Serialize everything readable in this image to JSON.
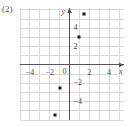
{
  "figure": {
    "item_label": "(2)",
    "background_color": "#ffffff",
    "grid_color": "#d9d9d9",
    "axis_color": "#555555",
    "point_color": "#1a1a1a",
    "label_color": "#4a4a4a"
  },
  "chart_data": {
    "type": "scatter",
    "title": "",
    "subtitle": "",
    "xlabel": "x",
    "ylabel": "y",
    "xlim": [
      -5,
      5.5
    ],
    "ylim": [
      -6,
      6.2
    ],
    "grid": true,
    "legend": false,
    "legend_position": "none",
    "xticks": [
      -4,
      -2,
      0,
      2,
      4
    ],
    "xtick_labels": [
      "−4",
      "−2",
      "0",
      "2",
      "4"
    ],
    "yticks": [
      -4,
      -2,
      2,
      4
    ],
    "ytick_labels": [
      "−4",
      "−2",
      "2",
      "4"
    ],
    "origin_label": "0",
    "x_axis_arrow": true,
    "y_axis_arrow": true,
    "points": [
      {
        "x": 1.5,
        "y": 5.5
      },
      {
        "x": 1.0,
        "y": 3.0
      },
      {
        "x": -1.0,
        "y": -2.5
      },
      {
        "x": -1.5,
        "y": -5.5
      }
    ],
    "series": [
      {
        "name": "points",
        "x": [
          1.5,
          1.0,
          -1.0,
          -1.5
        ],
        "values": [
          5.5,
          3.0,
          -2.5,
          -5.5
        ]
      }
    ]
  }
}
